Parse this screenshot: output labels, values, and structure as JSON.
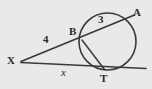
{
  "figure": {
    "background_color": "#e9e9e9",
    "stroke_color": "#3a3a3a",
    "width": 152,
    "height": 89
  },
  "points": [
    {
      "id": "X",
      "label": "X",
      "x": 22,
      "y": 61,
      "label_x": 7,
      "label_y": 56
    },
    {
      "id": "B",
      "label": "B",
      "x": 82,
      "y": 40,
      "label_x": 69,
      "label_y": 27
    },
    {
      "id": "A",
      "label": "A",
      "x": 131,
      "y": 17,
      "label_x": 134,
      "label_y": 8
    },
    {
      "id": "T",
      "label": "T",
      "x": 104,
      "y": 70,
      "label_x": 100,
      "label_y": 73
    }
  ],
  "circle": {
    "center_x": 107.5,
    "center_y": 41.5,
    "radius": 28.5
  },
  "segments": [
    {
      "id": "secant-XA",
      "from": "X",
      "to": "A"
    },
    {
      "id": "tangent-XT",
      "from": "X",
      "to": "tangent-end"
    },
    {
      "id": "chord-BT",
      "from": "B",
      "to": "T"
    }
  ],
  "measures": [
    {
      "id": "XB",
      "label": "4",
      "style": "len-label",
      "x": 44,
      "y": 36
    },
    {
      "id": "BA",
      "label": "3",
      "style": "len-label",
      "x": 99,
      "y": 15
    },
    {
      "id": "XT",
      "label": "x",
      "style": "var-label",
      "x": 62,
      "y": 68
    }
  ]
}
